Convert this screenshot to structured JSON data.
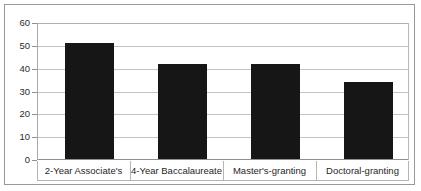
{
  "chart_data": {
    "type": "bar",
    "title": "",
    "xlabel": "",
    "ylabel": "",
    "categories": [
      "2-Year Associate's",
      "4-Year Baccalaureate",
      "Master's-granting",
      "Doctoral-granting"
    ],
    "values": [
      51,
      42,
      42,
      34
    ],
    "ylim": [
      0,
      60
    ],
    "yticks": [
      0,
      10,
      20,
      30,
      40,
      50,
      60
    ],
    "ytick_labels": [
      "0",
      "10",
      "20",
      "30",
      "40",
      "50",
      "60"
    ],
    "grid": true,
    "legend": "none",
    "bar_color": "#161616",
    "gridline_color": "#c3c3c3",
    "axis_color": "#8f8f8f",
    "background_color": "#ffffff"
  }
}
